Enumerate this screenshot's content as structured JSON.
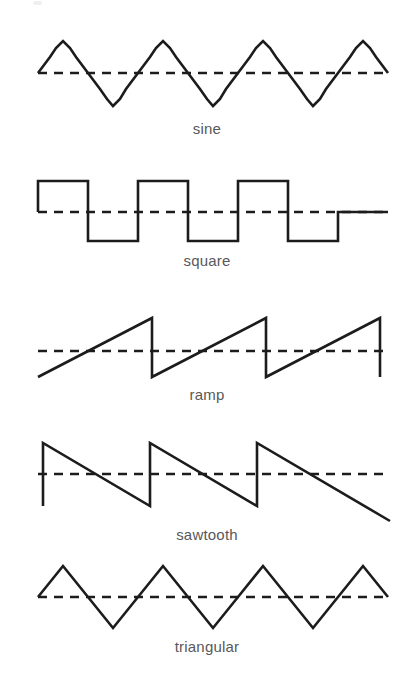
{
  "figure": {
    "background_color": "#ffffff",
    "stroke_color": "#1c1c1c",
    "label_color": "#58585a",
    "canvas": {
      "width": 414,
      "height": 684
    }
  },
  "chart_data": {
    "type": "line",
    "xlabel": "",
    "ylabel": "",
    "grid": false,
    "legend": "none",
    "annotations": [
      "sine",
      "square",
      "ramp",
      "sawtooth",
      "triangular"
    ],
    "shared": {
      "x_start": 38,
      "x_end": 390,
      "stroke_color": "#1c1c1c",
      "zero_line_style": "dashed"
    },
    "series": [
      {
        "name": "sine",
        "label": "sine",
        "waveform": "sine",
        "cycles": 3.5,
        "period_px": 100,
        "amplitude_px": 33,
        "zero_y": 73,
        "peak_y": 40,
        "trough_y": 106,
        "label_y": 122,
        "points": "38,73 50,57 56,48 63,41 70,48 76,57 88,73 100,89 107,99 113,106 120,99 126,89 138,73 150,57 156,48 163,41 170,48 176,57 188,73 200,89 207,99 213,106 220,99 226,89 238,73 250,57 256,48 263,41 270,48 276,57 288,73 300,89 307,99 313,106 320,99 326,89 338,73 350,57 356,48 363,41 370,48 376,57 388,73"
      },
      {
        "name": "square",
        "label": "square",
        "waveform": "square",
        "cycles": 3.5,
        "period_px": 100,
        "amplitude_px": 30,
        "zero_y": 212,
        "peak_y": 181,
        "trough_y": 241,
        "label_y": 261,
        "points": "38,212 38,181 88,181 88,241 138,241 138,181 188,181 188,241 238,241 238,181 288,181 288,241 338,241 338,212 388,212"
      },
      {
        "name": "ramp",
        "label": "ramp",
        "waveform": "ramp",
        "cycles": 3.1,
        "period_px": 114,
        "amplitude_px": 29,
        "zero_y": 351,
        "peak_y": 318,
        "trough_y": 377,
        "label_y": 393,
        "points": "38,377 152,318 152,377 266,318 266,377 380,318 380,377"
      },
      {
        "name": "sawtooth",
        "label": "sawtooth",
        "waveform": "sawtooth",
        "cycles": 3.2,
        "period_px": 107,
        "amplitude_px": 31,
        "zero_y": 474,
        "peak_y": 443,
        "trough_y": 506,
        "label_y": 525,
        "points": "43,506 43,443 150,506 150,443 257,506 257,443 390,521"
      },
      {
        "name": "triangular",
        "label": "triangular",
        "waveform": "triangle",
        "cycles": 3.5,
        "period_px": 100,
        "amplitude_px": 31,
        "zero_y": 597,
        "peak_y": 566,
        "trough_y": 628,
        "label_y": 653,
        "points": "38,597 63,566 88,597 113,628 138,597 163,566 188,597 213,628 238,597 263,566 288,597 313,628 338,597 363,566 388,597 388,597"
      }
    ]
  },
  "labels": {
    "sine": "sine",
    "square": "square",
    "ramp": "ramp",
    "sawtooth": "sawtooth",
    "triangular": "triangular"
  }
}
